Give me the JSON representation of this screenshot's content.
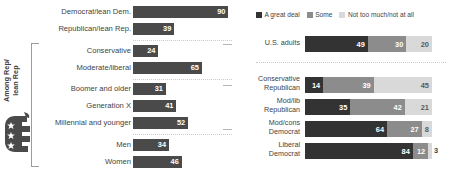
{
  "chart_data": [
    {
      "type": "bar",
      "title": "",
      "orientation": "horizontal",
      "xlabel": "",
      "ylabel": "",
      "xlim": [
        0,
        100
      ],
      "grid": false,
      "bar_color": "#4a4a4a",
      "group_label": "Among Rep/\nlean Rep",
      "group_label_line1": "Among Rep/",
      "group_label_line2": "lean Rep",
      "icon": "gop-elephant-icon",
      "categories": [
        "Democrat/lean Dem.",
        "Republican/lean Rep.",
        "Conservative",
        "Moderate/liberal",
        "Boomer and older",
        "Generation X",
        "Millennial and younger",
        "Men",
        "Women"
      ],
      "values": [
        90,
        39,
        24,
        65,
        31,
        41,
        52,
        34,
        46
      ],
      "separators_after": [
        "Republican/lean Rep.",
        "Moderate/liberal",
        "Millennial and younger"
      ]
    },
    {
      "type": "bar",
      "subtype": "stacked-100",
      "title": "",
      "orientation": "horizontal",
      "xlabel": "",
      "ylabel": "",
      "xlim": [
        0,
        100
      ],
      "grid": false,
      "legend_position": "top",
      "legend": [
        {
          "label": "A great deal",
          "color": "#333333"
        },
        {
          "label": "Some",
          "color": "#8c8c8c"
        },
        {
          "label": "Not too much/not at all",
          "color": "#d9d9d9"
        }
      ],
      "categories": [
        "U.S. adults",
        "Conservative\nRepublican",
        "Mod/lib\nRepublican",
        "Mod/cons\nDemocrat",
        "Liberal\nDemocrat"
      ],
      "category_lines": [
        [
          "U.S. adults",
          ""
        ],
        [
          "Conservative",
          "Republican"
        ],
        [
          "Mod/lib",
          "Republican"
        ],
        [
          "Mod/cons",
          "Democrat"
        ],
        [
          "Liberal",
          "Democrat"
        ]
      ],
      "series": [
        {
          "name": "A great deal",
          "values": [
            49,
            14,
            35,
            64,
            84
          ]
        },
        {
          "name": "Some",
          "values": [
            30,
            39,
            42,
            27,
            12
          ]
        },
        {
          "name": "Not too much/not at all",
          "values": [
            20,
            45,
            21,
            8,
            3
          ]
        }
      ],
      "separator_after": "U.S. adults"
    }
  ],
  "left": {
    "rows": [
      {
        "label": "Democrat/lean Dem.",
        "value": 90
      },
      {
        "label": "Republican/lean Rep.",
        "value": 39
      },
      {
        "label": "Conservative",
        "value": 24
      },
      {
        "label": "Moderate/liberal",
        "value": 65
      },
      {
        "label": "Boomer and older",
        "value": 31
      },
      {
        "label": "Generation X",
        "value": 41
      },
      {
        "label": "Millennial and younger",
        "value": 52
      },
      {
        "label": "Men",
        "value": 34
      },
      {
        "label": "Women",
        "value": 46
      }
    ],
    "group_label_line1": "Among Rep/",
    "group_label_line2": "lean Rep"
  },
  "right": {
    "legend": [
      {
        "label": "A great deal",
        "color": "#333333"
      },
      {
        "label": "Some",
        "color": "#8c8c8c"
      },
      {
        "label": "Not too much/not at all",
        "color": "#d9d9d9"
      }
    ],
    "rows": [
      {
        "line1": "U.S. adults",
        "line2": "",
        "segments": [
          49,
          30,
          20
        ]
      },
      {
        "line1": "Conservative",
        "line2": "Republican",
        "segments": [
          14,
          39,
          45
        ]
      },
      {
        "line1": "Mod/lib",
        "line2": "Republican",
        "segments": [
          35,
          42,
          21
        ]
      },
      {
        "line1": "Mod/cons",
        "line2": "Democrat",
        "segments": [
          64,
          27,
          8
        ]
      },
      {
        "line1": "Liberal",
        "line2": "Democrat",
        "segments": [
          84,
          12,
          3
        ]
      }
    ]
  },
  "colors": {
    "bar": "#4a4a4a",
    "great_deal": "#333333",
    "some": "#8c8c8c",
    "not_much": "#d9d9d9",
    "text": "#3f3f3f",
    "separator": "#c9c9c9"
  }
}
